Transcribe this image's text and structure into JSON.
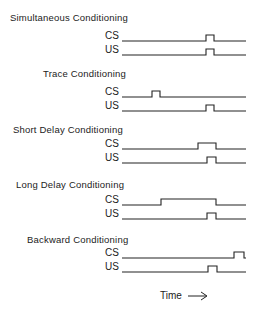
{
  "diagram": {
    "time_label": "Time",
    "time_arrow": "→",
    "line_start_x": 122,
    "line_end_x": 246,
    "panels": [
      {
        "title": "Simultaneous Conditioning",
        "title_x": 10,
        "title_y": 12,
        "signals": [
          {
            "label": "CS",
            "y": 41,
            "pulses": [
              [
                206,
                214
              ]
            ]
          },
          {
            "label": "US",
            "y": 55,
            "pulses": [
              [
                206,
                214
              ]
            ]
          }
        ]
      },
      {
        "title": "Trace Conditioning",
        "title_x": 43,
        "title_y": 68,
        "signals": [
          {
            "label": "CS",
            "y": 97,
            "pulses": [
              [
                152,
                160
              ]
            ]
          },
          {
            "label": "US",
            "y": 111,
            "pulses": [
              [
                206,
                214
              ]
            ]
          }
        ]
      },
      {
        "title": "Short Delay Conditioning",
        "title_x": 13,
        "title_y": 124,
        "signals": [
          {
            "label": "CS",
            "y": 149,
            "pulses": [
              [
                198,
                216
              ]
            ]
          },
          {
            "label": "US",
            "y": 163,
            "pulses": [
              [
                207,
                216
              ]
            ]
          }
        ]
      },
      {
        "title": "Long Delay Conditioning",
        "title_x": 16,
        "title_y": 179,
        "signals": [
          {
            "label": "CS",
            "y": 205,
            "pulses": [
              [
                161,
                216
              ]
            ]
          },
          {
            "label": "US",
            "y": 219,
            "pulses": [
              [
                207,
                216
              ]
            ]
          }
        ]
      },
      {
        "title": "Backward Conditioning",
        "title_x": 27,
        "title_y": 234,
        "signals": [
          {
            "label": "CS",
            "y": 258,
            "pulses": [
              [
                234,
                244
              ]
            ]
          },
          {
            "label": "US",
            "y": 272,
            "pulses": [
              [
                208,
                217
              ]
            ]
          }
        ]
      }
    ],
    "pulse_height": 6,
    "stroke_color": "#222222"
  }
}
